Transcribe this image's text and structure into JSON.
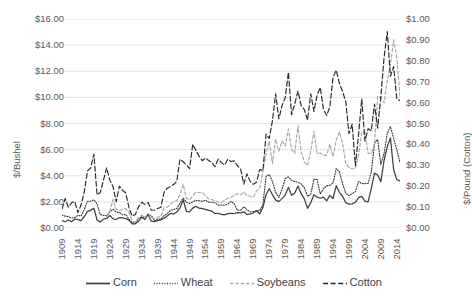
{
  "chart_data": {
    "type": "line",
    "title": "",
    "xlabel": "",
    "ylabel": "$/Bushel",
    "ylabel_secondary": "$/Pound (Cotton)",
    "grid": true,
    "legend_position": "bottom",
    "xlim": [
      1909,
      2015
    ],
    "ylim": [
      0,
      16
    ],
    "ylim_secondary": [
      0,
      1.0
    ],
    "ytick_labels": [
      "$0.00",
      "$2.00",
      "$4.00",
      "$6.00",
      "$8.00",
      "$10.00",
      "$12.00",
      "$14.00",
      "$16.00"
    ],
    "ytick_values": [
      0,
      2,
      4,
      6,
      8,
      10,
      12,
      14,
      16
    ],
    "ytick_labels_secondary": [
      "$0.00",
      "$0.10",
      "$0.20",
      "$0.30",
      "$0.40",
      "$0.50",
      "$0.60",
      "$0.70",
      "$0.80",
      "$0.90",
      "$1.00"
    ],
    "ytick_values_secondary": [
      0,
      0.1,
      0.2,
      0.3,
      0.4,
      0.5,
      0.6,
      0.7,
      0.8,
      0.9,
      1.0
    ],
    "xtick_labels": [
      "1909",
      "1914",
      "1919",
      "1924",
      "1929",
      "1934",
      "1939",
      "1944",
      "1949",
      "1954",
      "1959",
      "1964",
      "1969",
      "1974",
      "1979",
      "1984",
      "1989",
      "1994",
      "1999",
      "2004",
      "2009",
      "2014"
    ],
    "xtick_values": [
      1909,
      1914,
      1919,
      1924,
      1929,
      1934,
      1939,
      1944,
      1949,
      1954,
      1959,
      1964,
      1969,
      1974,
      1979,
      1984,
      1989,
      1994,
      1999,
      2004,
      2009,
      2014
    ],
    "x": [
      1909,
      1910,
      1911,
      1912,
      1913,
      1914,
      1915,
      1916,
      1917,
      1918,
      1919,
      1920,
      1921,
      1922,
      1923,
      1924,
      1925,
      1926,
      1927,
      1928,
      1929,
      1930,
      1931,
      1932,
      1933,
      1934,
      1935,
      1936,
      1937,
      1938,
      1939,
      1940,
      1941,
      1942,
      1943,
      1944,
      1945,
      1946,
      1947,
      1948,
      1949,
      1950,
      1951,
      1952,
      1953,
      1954,
      1955,
      1956,
      1957,
      1958,
      1959,
      1960,
      1961,
      1962,
      1963,
      1964,
      1965,
      1966,
      1967,
      1968,
      1969,
      1970,
      1971,
      1972,
      1973,
      1974,
      1975,
      1976,
      1977,
      1978,
      1979,
      1980,
      1981,
      1982,
      1983,
      1984,
      1985,
      1986,
      1987,
      1988,
      1989,
      1990,
      1991,
      1992,
      1993,
      1994,
      1995,
      1996,
      1997,
      1998,
      1999,
      2000,
      2001,
      2002,
      2003,
      2004,
      2005,
      2006,
      2007,
      2008,
      2009,
      2010,
      2011,
      2012,
      2013,
      2014,
      2015
    ],
    "series": [
      {
        "name": "Corn",
        "axis": "left",
        "unit": "$/Bushel",
        "color": "#404040",
        "style": "solid",
        "values": [
          0.57,
          0.48,
          0.61,
          0.48,
          0.69,
          0.64,
          0.57,
          0.88,
          1.27,
          1.35,
          1.51,
          0.61,
          0.45,
          0.68,
          0.73,
          0.96,
          0.7,
          0.65,
          0.8,
          0.77,
          0.72,
          0.6,
          0.32,
          0.32,
          0.52,
          0.82,
          0.66,
          1.04,
          0.52,
          0.49,
          0.57,
          0.62,
          0.75,
          0.92,
          1.12,
          1.07,
          1.23,
          1.53,
          2.16,
          1.28,
          1.24,
          1.52,
          1.66,
          1.52,
          1.48,
          1.43,
          1.35,
          1.29,
          1.11,
          1.12,
          1.05,
          1.0,
          1.1,
          1.12,
          1.11,
          1.17,
          1.16,
          1.24,
          1.03,
          1.08,
          1.15,
          1.33,
          1.08,
          1.57,
          2.55,
          3.02,
          2.54,
          2.15,
          2.02,
          2.25,
          2.52,
          3.11,
          2.5,
          2.68,
          3.21,
          2.63,
          2.23,
          1.5,
          1.94,
          2.54,
          2.36,
          2.28,
          2.37,
          2.07,
          2.5,
          2.26,
          3.24,
          2.71,
          2.43,
          1.94,
          1.82,
          1.85,
          1.97,
          2.32,
          2.42,
          2.06,
          2.0,
          3.04,
          4.2,
          4.06,
          3.55,
          5.18,
          6.22,
          6.89,
          4.46,
          3.7,
          3.61
        ]
      },
      {
        "name": "Wheat",
        "axis": "left",
        "unit": "$/Bushel",
        "color": "#3a3a3a",
        "style": "dotted",
        "values": [
          0.98,
          0.91,
          0.87,
          0.76,
          0.8,
          0.97,
          0.92,
          1.43,
          2.05,
          2.05,
          2.16,
          1.83,
          1.03,
          0.97,
          0.93,
          1.25,
          1.44,
          1.22,
          1.19,
          1.0,
          1.04,
          0.67,
          0.39,
          0.38,
          0.74,
          0.85,
          0.83,
          1.03,
          0.96,
          0.56,
          0.69,
          0.68,
          0.94,
          1.1,
          1.36,
          1.41,
          1.49,
          1.9,
          2.29,
          1.98,
          1.88,
          2.0,
          2.11,
          2.09,
          2.04,
          2.12,
          1.98,
          1.97,
          1.93,
          1.75,
          1.76,
          1.74,
          1.83,
          2.04,
          1.85,
          1.37,
          1.35,
          1.63,
          1.39,
          1.24,
          1.25,
          1.33,
          1.34,
          1.76,
          3.95,
          4.09,
          3.56,
          2.73,
          2.33,
          2.97,
          3.78,
          3.91,
          3.65,
          3.55,
          3.51,
          3.39,
          3.08,
          2.42,
          2.57,
          3.72,
          3.72,
          2.61,
          3.0,
          3.24,
          3.26,
          3.45,
          4.55,
          4.3,
          3.38,
          2.65,
          2.48,
          2.62,
          2.78,
          3.56,
          3.4,
          3.4,
          3.42,
          4.26,
          6.48,
          6.78,
          4.87,
          5.7,
          7.24,
          7.77,
          6.87,
          5.99,
          5.0
        ]
      },
      {
        "name": "Soybeans",
        "axis": "left",
        "unit": "$/Bushel",
        "color": "#a6a6a6",
        "style": "dashed",
        "values": [
          null,
          null,
          null,
          null,
          null,
          null,
          null,
          null,
          null,
          null,
          null,
          null,
          null,
          null,
          null,
          1.24,
          2.2,
          1.45,
          1.33,
          1.46,
          1.48,
          1.22,
          0.54,
          0.44,
          0.78,
          0.99,
          0.79,
          1.11,
          0.82,
          0.7,
          0.82,
          0.9,
          1.55,
          1.6,
          1.81,
          2.05,
          2.08,
          2.57,
          3.33,
          2.27,
          2.16,
          2.47,
          2.73,
          2.72,
          2.72,
          2.46,
          2.22,
          2.18,
          2.07,
          2.0,
          1.96,
          2.13,
          2.28,
          2.34,
          2.51,
          2.62,
          2.54,
          2.75,
          2.49,
          2.43,
          2.35,
          2.85,
          3.03,
          4.37,
          5.68,
          6.64,
          4.92,
          6.81,
          5.88,
          6.66,
          6.28,
          7.57,
          6.04,
          5.71,
          7.83,
          5.84,
          5.05,
          4.78,
          5.88,
          7.42,
          5.69,
          5.74,
          5.58,
          5.56,
          6.4,
          5.48,
          6.72,
          7.35,
          6.47,
          4.93,
          4.63,
          4.54,
          4.54,
          5.53,
          7.34,
          7.34,
          5.74,
          5.66,
          6.43,
          10.1,
          9.97,
          9.59,
          11.3,
          12.5,
          14.4,
          13.0,
          10.1
        ]
      },
      {
        "name": "Cotton",
        "axis": "right",
        "unit": "$/Pound",
        "color": "#262626",
        "style": "longdash",
        "values": [
          0.091,
          0.141,
          0.099,
          0.121,
          0.127,
          0.074,
          0.111,
          0.174,
          0.273,
          0.288,
          0.353,
          0.159,
          0.17,
          0.228,
          0.288,
          0.229,
          0.198,
          0.126,
          0.201,
          0.18,
          0.167,
          0.097,
          0.057,
          0.065,
          0.102,
          0.123,
          0.113,
          0.122,
          0.085,
          0.086,
          0.093,
          0.099,
          0.17,
          0.191,
          0.198,
          0.208,
          0.224,
          0.329,
          0.317,
          0.302,
          0.284,
          0.401,
          0.372,
          0.343,
          0.322,
          0.335,
          0.323,
          0.314,
          0.293,
          0.33,
          0.313,
          0.301,
          0.329,
          0.318,
          0.321,
          0.298,
          0.284,
          0.21,
          0.259,
          0.223,
          0.209,
          0.219,
          0.28,
          0.274,
          0.449,
          0.429,
          0.514,
          0.642,
          0.522,
          0.585,
          0.623,
          0.745,
          0.542,
          0.594,
          0.655,
          0.587,
          0.566,
          0.516,
          0.642,
          0.558,
          0.635,
          0.672,
          0.568,
          0.538,
          0.58,
          0.721,
          0.755,
          0.692,
          0.653,
          0.603,
          0.452,
          0.497,
          0.298,
          0.446,
          0.618,
          0.416,
          0.475,
          0.465,
          0.593,
          0.478,
          0.629,
          0.815,
          0.94,
          0.726,
          0.772,
          0.617,
          0.61
        ]
      }
    ]
  },
  "legend": {
    "items": [
      {
        "label": "Corn",
        "style": "solid",
        "color": "#404040"
      },
      {
        "label": "Wheat",
        "style": "dotted",
        "color": "#3a3a3a"
      },
      {
        "label": "Soybeans",
        "style": "dashed",
        "color": "#a6a6a6"
      },
      {
        "label": "Cotton",
        "style": "longdash",
        "color": "#262626"
      }
    ]
  }
}
